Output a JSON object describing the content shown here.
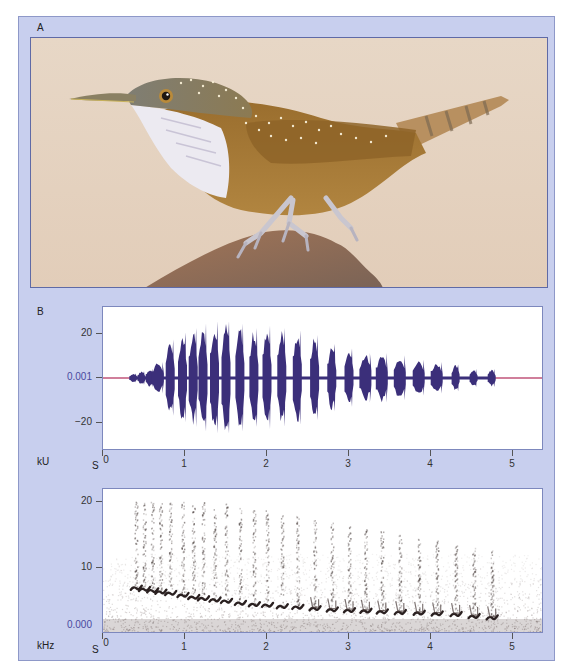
{
  "figure": {
    "panel_a_label": "A",
    "panel_b_label": "B",
    "illustration": {
      "subject": "bird-on-rock",
      "colors": {
        "background": "#e6d3c2",
        "body": "#a87a34",
        "head": "#7d7c6f",
        "throat": "#ecebf0",
        "rock": "#8a6a55",
        "legs": "#c9c6cf",
        "spots": "#f2e8c8"
      }
    }
  },
  "colors": {
    "panel_background": "#c8cfee",
    "panel_border": "#8e98c8",
    "waveform": "#3b2f7a",
    "zero_line": "#c0557a",
    "axis_zero_label": "#4a4aa0",
    "spectrogram_ink": "#2a2020"
  },
  "waveform": {
    "unit_label": "kU",
    "x_unit_label": "S",
    "y_ticks": [
      "20",
      "0.001",
      "−20"
    ],
    "x_ticks": [
      "0",
      "1",
      "2",
      "3",
      "4",
      "5"
    ]
  },
  "spectrogram": {
    "unit_label": "kHz",
    "x_unit_label": "S",
    "y_ticks": [
      "20",
      "10",
      "0.000"
    ],
    "x_ticks": [
      "0",
      "1",
      "2",
      "3",
      "4",
      "5"
    ]
  },
  "chart_data": [
    {
      "type": "area",
      "title": "Waveform (oscillogram)",
      "xlabel": "S",
      "ylabel": "kU",
      "xlim": [
        0,
        5.4
      ],
      "ylim": [
        -30,
        30
      ],
      "y_tick_values": [
        20,
        0.001,
        -20
      ],
      "x_tick_values": [
        0,
        1,
        2,
        3,
        4,
        5
      ],
      "grid": false,
      "syllables": [
        {
          "t": 0.37,
          "amp": 2
        },
        {
          "t": 0.47,
          "amp": 3
        },
        {
          "t": 0.57,
          "amp": 4
        },
        {
          "t": 0.67,
          "amp": 7
        },
        {
          "t": 0.82,
          "amp": 17
        },
        {
          "t": 0.97,
          "amp": 20
        },
        {
          "t": 1.1,
          "amp": 22
        },
        {
          "t": 1.22,
          "amp": 24
        },
        {
          "t": 1.36,
          "amp": 25
        },
        {
          "t": 1.5,
          "amp": 25
        },
        {
          "t": 1.67,
          "amp": 24
        },
        {
          "t": 1.84,
          "amp": 22
        },
        {
          "t": 2.0,
          "amp": 23
        },
        {
          "t": 2.18,
          "amp": 22
        },
        {
          "t": 2.37,
          "amp": 21
        },
        {
          "t": 2.58,
          "amp": 19
        },
        {
          "t": 2.79,
          "amp": 15
        },
        {
          "t": 3.0,
          "amp": 13
        },
        {
          "t": 3.2,
          "amp": 11
        },
        {
          "t": 3.4,
          "amp": 11
        },
        {
          "t": 3.62,
          "amp": 10
        },
        {
          "t": 3.85,
          "amp": 8
        },
        {
          "t": 4.07,
          "amp": 7
        },
        {
          "t": 4.3,
          "amp": 6
        },
        {
          "t": 4.52,
          "amp": 4
        },
        {
          "t": 4.74,
          "amp": 4
        }
      ]
    },
    {
      "type": "heatmap",
      "title": "Spectrogram",
      "xlabel": "S",
      "ylabel": "kHz",
      "xlim": [
        0,
        5.4
      ],
      "ylim": [
        0,
        22
      ],
      "y_tick_values": [
        20,
        10,
        0
      ],
      "x_tick_values": [
        0,
        1,
        2,
        3,
        4,
        5
      ],
      "grid": false,
      "notes": [
        {
          "t": 0.4,
          "f_low": 5.8
        },
        {
          "t": 0.5,
          "f_low": 5.6
        },
        {
          "t": 0.6,
          "f_low": 5.4
        },
        {
          "t": 0.7,
          "f_low": 5.2
        },
        {
          "t": 0.82,
          "f_low": 5.0
        },
        {
          "t": 0.97,
          "f_low": 4.7
        },
        {
          "t": 1.1,
          "f_low": 4.4
        },
        {
          "t": 1.22,
          "f_low": 4.2
        },
        {
          "t": 1.36,
          "f_low": 4.0
        },
        {
          "t": 1.5,
          "f_low": 3.8
        },
        {
          "t": 1.67,
          "f_low": 3.5
        },
        {
          "t": 1.84,
          "f_low": 3.3
        },
        {
          "t": 2.0,
          "f_low": 3.2
        },
        {
          "t": 2.18,
          "f_low": 3.0
        },
        {
          "t": 2.37,
          "f_low": 2.9
        },
        {
          "t": 2.58,
          "f_low": 2.7
        },
        {
          "t": 2.79,
          "f_low": 2.5
        },
        {
          "t": 3.0,
          "f_low": 2.4
        },
        {
          "t": 3.2,
          "f_low": 2.3
        },
        {
          "t": 3.4,
          "f_low": 2.2
        },
        {
          "t": 3.62,
          "f_low": 2.1
        },
        {
          "t": 3.85,
          "f_low": 2.0
        },
        {
          "t": 4.07,
          "f_low": 1.9
        },
        {
          "t": 4.3,
          "f_low": 1.8
        },
        {
          "t": 4.52,
          "f_low": 1.5
        },
        {
          "t": 4.74,
          "f_low": 1.3
        }
      ],
      "harmonic_max_khz": 19,
      "noise_floor_khz": 9
    }
  ]
}
